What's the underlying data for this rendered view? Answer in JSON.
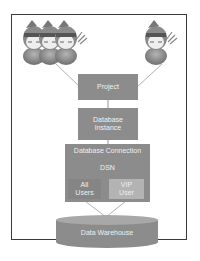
{
  "diagram": {
    "title": "",
    "actors": {
      "group_left": {
        "icon": "ninja-user-group-icon",
        "count": 3
      },
      "single_right": {
        "icon": "ninja-user-icon",
        "count": 1
      }
    },
    "nodes": {
      "project": "Project",
      "database_instance": "Database Instance",
      "database_instance_line1": "Database",
      "database_instance_line2": "Instance",
      "database_connection": "Database Connection",
      "dsn": "DSN",
      "all_users_line1": "All",
      "all_users_line2": "Users",
      "vip_users_line1": "VIP",
      "vip_users_line2": "User",
      "data_warehouse": "Data Warehouse"
    },
    "edges": [
      {
        "from": "user-group",
        "to": "project"
      },
      {
        "from": "single-user",
        "to": "project"
      },
      {
        "from": "project",
        "to": "database_instance"
      },
      {
        "from": "database_instance",
        "to": "database_connection"
      },
      {
        "from": "all_users",
        "to": "data_warehouse"
      },
      {
        "from": "vip_users",
        "to": "data_warehouse"
      }
    ],
    "colors": {
      "box": "#8c8c8c",
      "box_dark": "#7a7a7a",
      "vip_box": "#b3b3b3",
      "text": "#f2f2f2",
      "frame": "#3a3a3a",
      "line": "#9a9a9a"
    }
  }
}
